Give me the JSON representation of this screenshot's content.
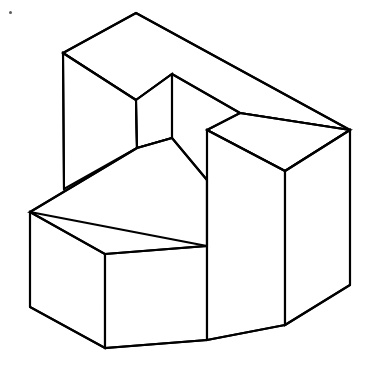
{
  "figure": {
    "width": 369,
    "height": 373,
    "background_color": "#ffffff",
    "line_color": "#000000",
    "line_width": 2.1,
    "artifact": {
      "name": "speck",
      "x": 9,
      "y": 11,
      "color": "#5a5a5a"
    },
    "faces": [
      {
        "name": "back-wall-top-face",
        "points": "63,53 136,13 350,130 240,113 172,74 136,100"
      },
      {
        "name": "back-wall-left-face",
        "points": "63,53 136,100 137,148 64,189"
      },
      {
        "name": "notch-inner-left-face",
        "points": "136,100 172,74 172,138 137,148"
      },
      {
        "name": "arm-top-face",
        "points": "137,148 172,138 207,180 207,246 30,212"
      },
      {
        "name": "arm-left-face",
        "points": "30,212 30,307 105,348 105,254"
      },
      {
        "name": "arm-front-face",
        "points": "105,254 207,246 207,340 105,348"
      },
      {
        "name": "right-block-top-face",
        "points": "207,130 240,113 350,130 285,171"
      },
      {
        "name": "right-block-left-face",
        "points": "207,130 285,171 285,325 207,340"
      },
      {
        "name": "right-block-right-face",
        "points": "285,171 350,130 350,285 285,325"
      }
    ],
    "edges": [
      {
        "name": "edge-apex-to-left-corner",
        "d": "M63,53 L136,13"
      },
      {
        "name": "edge-apex-to-right-corner",
        "d": "M136,13 L350,130"
      },
      {
        "name": "edge-left-corner-vertical",
        "d": "M63,53 L64,189"
      },
      {
        "name": "edge-left-corner-to-inner",
        "d": "M63,53 L136,100"
      },
      {
        "name": "edge-inner-vertical-left",
        "d": "M136,100 L137,148"
      },
      {
        "name": "edge-inner-top-to-notch-apex",
        "d": "M136,100 L172,74"
      },
      {
        "name": "edge-notch-apex-vertical",
        "d": "M172,74 L172,138"
      },
      {
        "name": "edge-notch-apex-to-right",
        "d": "M172,74 L240,113"
      },
      {
        "name": "edge-notch-right-to-right-corner",
        "d": "M240,113 L350,130"
      },
      {
        "name": "edge-notch-right-to-block-top",
        "d": "M240,113 L207,130"
      },
      {
        "name": "edge-block-top-to-right-corner",
        "d": "M207,130 L285,171"
      },
      {
        "name": "edge-block-top-right-to-far-right",
        "d": "M285,171 L350,130"
      },
      {
        "name": "edge-far-right-vertical",
        "d": "M350,130 L350,285"
      },
      {
        "name": "edge-block-front-vertical",
        "d": "M285,171 L285,325"
      },
      {
        "name": "edge-block-left-vertical",
        "d": "M207,130 L207,340"
      },
      {
        "name": "edge-block-bottom-right",
        "d": "M285,325 L350,285"
      },
      {
        "name": "edge-block-bottom-left",
        "d": "M207,340 L285,325"
      },
      {
        "name": "edge-inner-bottom-to-notch-bottom",
        "d": "M137,148 L172,138"
      },
      {
        "name": "edge-notch-bottom-to-block",
        "d": "M172,138 L207,180"
      },
      {
        "name": "edge-arm-top-back",
        "d": "M137,148 L30,212"
      },
      {
        "name": "edge-arm-left-vertical",
        "d": "M30,212 L30,307"
      },
      {
        "name": "edge-arm-top-front",
        "d": "M30,212 L105,254"
      },
      {
        "name": "edge-arm-front-vertical",
        "d": "M105,254 L105,348"
      },
      {
        "name": "edge-arm-front-top",
        "d": "M105,254 L207,246"
      },
      {
        "name": "edge-arm-bottom-left",
        "d": "M30,307 L105,348"
      },
      {
        "name": "edge-arm-bottom-front",
        "d": "M105,348 L207,340"
      },
      {
        "name": "edge-arm-right-vertical",
        "d": "M207,180 L207,246"
      }
    ]
  }
}
